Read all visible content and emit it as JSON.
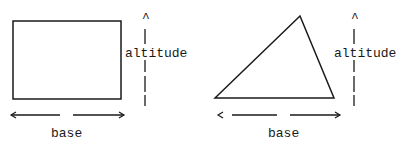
{
  "diagram": {
    "rectangle": {
      "altitude_label": "altitude",
      "base_label": "base",
      "base_left_arrow": "<",
      "base_right_arrow": ">",
      "altitude_arrow": "^"
    },
    "triangle": {
      "altitude_label": "altitude",
      "base_label": "base",
      "base_left_arrow": "<",
      "base_right_arrow": ">",
      "altitude_arrow": "^"
    },
    "colors": {
      "stroke": "#1a1a1a",
      "background": "#ffffff"
    }
  }
}
